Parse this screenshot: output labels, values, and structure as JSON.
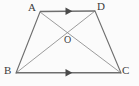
{
  "figure": {
    "kind": "geometry-diagram",
    "shape_name": "trapezoid-with-diagonals",
    "canvas": {
      "width": 139,
      "height": 86
    },
    "colors": {
      "background": "#fbfbfb",
      "stroke": "#6e6e6e",
      "stroke_light": "#8a8a8a",
      "label": "#3b3b3b"
    },
    "vertices": [
      {
        "id": "A",
        "label": "A",
        "x": 40,
        "y": 12,
        "label_x": 28,
        "label_y": 3
      },
      {
        "id": "D",
        "label": "D",
        "x": 95,
        "y": 11,
        "label_x": 97,
        "label_y": 2
      },
      {
        "id": "B",
        "label": "B",
        "x": 16,
        "y": 73,
        "label_x": 4,
        "label_y": 66
      },
      {
        "id": "C",
        "label": "C",
        "x": 121,
        "y": 73,
        "label_x": 123,
        "label_y": 66
      },
      {
        "id": "O",
        "label": "O",
        "x": 69,
        "y": 42,
        "label_x": 64,
        "label_y": 36
      }
    ],
    "edges": [
      {
        "id": "AD",
        "from": "A",
        "to": "D",
        "marker": "arrow-right",
        "style": "solid",
        "weight": "bold"
      },
      {
        "id": "BC",
        "from": "B",
        "to": "C",
        "marker": "arrow-right",
        "style": "solid",
        "weight": "bold"
      },
      {
        "id": "AB",
        "from": "A",
        "to": "B",
        "marker": "none",
        "style": "solid",
        "weight": "normal"
      },
      {
        "id": "DC",
        "from": "D",
        "to": "C",
        "marker": "none",
        "style": "solid",
        "weight": "normal"
      }
    ],
    "diagonals": [
      {
        "id": "AC",
        "from": "A",
        "to": "C",
        "style": "solid",
        "weight": "thin"
      },
      {
        "id": "BD",
        "from": "B",
        "to": "D",
        "style": "solid",
        "weight": "thin"
      }
    ],
    "intersection": {
      "id": "O",
      "label": "O",
      "of": [
        "AC",
        "BD"
      ],
      "x": 69,
      "y": 42
    },
    "arrow_markers": [
      {
        "id": "arrow-ad",
        "on_edge": "AD",
        "x": 69,
        "y": 11,
        "direction": "right"
      },
      {
        "id": "arrow-bc",
        "on_edge": "BC",
        "x": 69,
        "y": 72,
        "direction": "right"
      }
    ]
  }
}
